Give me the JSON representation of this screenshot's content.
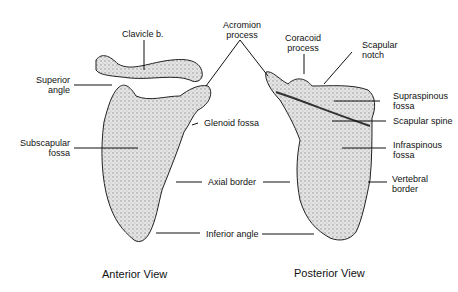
{
  "labels": {
    "clavicle": "Clavicle b.",
    "acromion_1": "Acromion",
    "acromion_2": "process",
    "coracoid_1": "Coracoid",
    "coracoid_2": "process",
    "notch_1": "Scapular",
    "notch_2": "notch",
    "superior_1": "Superior",
    "superior_2": "angle",
    "supraspinous_1": "Supraspinous",
    "supraspinous_2": "fossa",
    "glenoid": "Glenoid fossa",
    "spine": "Scapular spine",
    "subscapular_1": "Subscapular",
    "subscapular_2": "fossa",
    "infraspinous_1": "Infraspinous",
    "infraspinous_2": "fossa",
    "axial": "Axial border",
    "vertebral_1": "Vertebral",
    "vertebral_2": "border",
    "inferior": "Inferior angle"
  },
  "captions": {
    "anterior": "Anterior View",
    "posterior": "Posterior View"
  }
}
